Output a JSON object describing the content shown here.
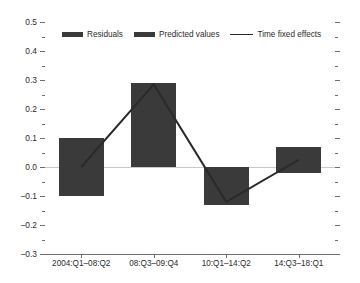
{
  "chart_data": {
    "type": "bar",
    "title": "",
    "xlabel": "",
    "ylabel": "",
    "ylim": [
      -0.3,
      0.5
    ],
    "ytick_step": 0.1,
    "minor_ticks": true,
    "grid": false,
    "zero_line": true,
    "legend_position": "top",
    "categories": [
      "2004:Q1–08:Q2",
      "08:Q3–09:Q4",
      "10:Q1–14:Q2",
      "14:Q3–18:Q1"
    ],
    "ytick_labels": [
      "0.5",
      "0.4",
      "0.3",
      "0.2",
      "0.1",
      "0.0",
      "–0.1",
      "–0.2",
      "–0.3"
    ],
    "ytick_values": [
      0.5,
      0.4,
      0.3,
      0.2,
      0.1,
      0.0,
      -0.1,
      -0.2,
      -0.3
    ],
    "series": [
      {
        "name": "Residuals",
        "type": "bar",
        "color": "#3a3a3a",
        "bar_low": [
          -0.1,
          0.0,
          -0.13,
          -0.02
        ],
        "bar_high": [
          0.1,
          0.29,
          0.0,
          0.07
        ]
      },
      {
        "name": "Predicted values",
        "type": "bar",
        "color": "#3a3a3a"
      },
      {
        "name": "Time fixed effects",
        "type": "line",
        "color": "#2a2a2a",
        "values": [
          0.0,
          0.285,
          -0.12,
          0.025
        ]
      }
    ]
  },
  "legend": {
    "items": [
      {
        "label": "Residuals",
        "marker": "bar-swatch-icon"
      },
      {
        "label": "Predicted values",
        "marker": "bar-swatch-icon"
      },
      {
        "label": "Time fixed effects",
        "marker": "line-swatch-icon"
      }
    ]
  },
  "colors": {
    "bar": "#3a3a3a",
    "line": "#2a2a2a",
    "axis": "#6d6d6d",
    "zero_line": "#c9c9c9",
    "background": "#ffffff",
    "text": "#2b2b2b"
  }
}
